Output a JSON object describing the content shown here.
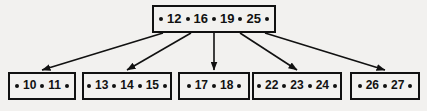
{
  "diagram": {
    "type": "b-tree",
    "colors": {
      "background": "#f2f1ef",
      "stroke": "#111111",
      "node_fill": "#f2f1ef",
      "text": "#111111"
    },
    "dot_glyph": "•",
    "root": {
      "name": "root-node",
      "keys": [
        "12",
        "16",
        "19",
        "25"
      ],
      "pointer_count": 5,
      "box": {
        "x": 152,
        "y": 5,
        "w": 124,
        "h": 28
      }
    },
    "leaves": [
      {
        "name": "leaf-node-1",
        "keys": [
          "10",
          "11"
        ],
        "pointer_count": 3,
        "box": {
          "x": 8,
          "y": 72,
          "w": 68,
          "h": 28
        }
      },
      {
        "name": "leaf-node-2",
        "keys": [
          "13",
          "14",
          "15"
        ],
        "pointer_count": 4,
        "box": {
          "x": 82,
          "y": 72,
          "w": 90,
          "h": 28
        }
      },
      {
        "name": "leaf-node-3",
        "keys": [
          "17",
          "18"
        ],
        "pointer_count": 3,
        "box": {
          "x": 178,
          "y": 72,
          "w": 72,
          "h": 28
        }
      },
      {
        "name": "leaf-node-4",
        "keys": [
          "22",
          "23",
          "24"
        ],
        "pointer_count": 4,
        "box": {
          "x": 252,
          "y": 72,
          "w": 90,
          "h": 28
        }
      },
      {
        "name": "leaf-node-5",
        "keys": [
          "26",
          "27"
        ],
        "pointer_count": 3,
        "box": {
          "x": 350,
          "y": 72,
          "w": 70,
          "h": 28
        }
      }
    ],
    "edges": [
      {
        "name": "edge-root-to-leaf-1",
        "from": [
          163,
          33
        ],
        "to": [
          42,
          70
        ]
      },
      {
        "name": "edge-root-to-leaf-2",
        "from": [
          191,
          33
        ],
        "to": [
          127,
          70
        ]
      },
      {
        "name": "edge-root-to-leaf-3",
        "from": [
          214,
          33
        ],
        "to": [
          214,
          70
        ]
      },
      {
        "name": "edge-root-to-leaf-4",
        "from": [
          240,
          33
        ],
        "to": [
          297,
          70
        ]
      },
      {
        "name": "edge-root-to-leaf-5",
        "from": [
          265,
          33
        ],
        "to": [
          385,
          70
        ]
      }
    ]
  }
}
